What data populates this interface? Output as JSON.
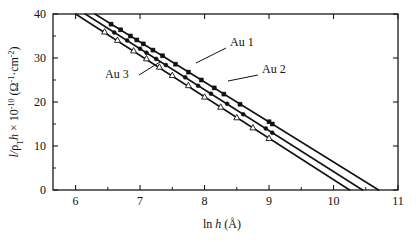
{
  "chart_data": {
    "type": "line",
    "title": "",
    "xlabel": "ln h (Å)",
    "ylabel": "l/ρTh × 10-10 (Ω-1·cm-2)",
    "ylabel_parts": {
      "lead": "l/",
      "rho": "ρ",
      "rho_sub": "T",
      "h": "h",
      "times": " × 10",
      "exp": "-10",
      "unit_open": " (Ω",
      "unit_exp1": "-1",
      "unit_mid": "·cm",
      "unit_exp2": "-2",
      "unit_close": ")"
    },
    "xlabel_parts": {
      "ln": "ln ",
      "h": "h",
      "unit": " (Å)"
    },
    "xlim": [
      5.65,
      11.0
    ],
    "ylim": [
      0,
      40
    ],
    "xticks": [
      6,
      7,
      8,
      9,
      10,
      11
    ],
    "xtick_labels": [
      "6",
      "7",
      "8",
      "9",
      "10",
      "11"
    ],
    "yticks": [
      0,
      10,
      20,
      30,
      40
    ],
    "ytick_labels": [
      "0",
      "10",
      "20",
      "30",
      "40"
    ],
    "xminor_ticks": [
      6.5,
      7.5,
      8.5,
      9.5,
      10.5
    ],
    "yminor_ticks": [
      5,
      15,
      25,
      35
    ],
    "grid": false,
    "legend_position": "inline-annotations",
    "series": [
      {
        "name": "Au 1",
        "marker": "filled-square",
        "fit_x": [
          6.3,
          10.7
        ],
        "fit_y": [
          40.0,
          0.0
        ],
        "slope": -9.09,
        "intercept": 97.27,
        "points_x": [
          6.55,
          6.7,
          6.85,
          6.95,
          7.05,
          7.2,
          7.35,
          7.55,
          7.75,
          7.95,
          8.15,
          8.3,
          8.55,
          9.0,
          9.05
        ],
        "points_y": [
          37.7,
          36.4,
          35.0,
          34.1,
          33.2,
          31.8,
          30.5,
          28.6,
          26.8,
          25.0,
          23.2,
          21.8,
          19.5,
          15.5,
          15.0
        ]
      },
      {
        "name": "Au 2",
        "marker": "filled-dot",
        "fit_x": [
          6.15,
          10.45
        ],
        "fit_y": [
          40.0,
          0.0
        ],
        "slope": -9.3,
        "intercept": 97.21,
        "points_x": [
          6.6,
          6.8,
          7.0,
          7.1,
          7.25,
          7.4,
          7.7,
          7.9,
          8.1,
          8.35,
          8.6,
          8.95,
          9.05
        ],
        "points_y": [
          35.8,
          34.0,
          32.1,
          31.2,
          29.8,
          28.4,
          25.6,
          23.7,
          21.9,
          19.6,
          17.2,
          14.0,
          13.0
        ]
      },
      {
        "name": "Au 3",
        "marker": "open-triangle",
        "fit_x": [
          6.0,
          10.25
        ],
        "fit_y": [
          40.0,
          0.0
        ],
        "slope": -9.41,
        "intercept": 96.47,
        "points_x": [
          6.45,
          6.65,
          6.9,
          7.1,
          7.3,
          7.5,
          7.75,
          8.0,
          8.25,
          8.5,
          8.75,
          9.0
        ],
        "points_y": [
          36.0,
          34.1,
          31.7,
          29.9,
          28.0,
          26.1,
          23.8,
          21.2,
          18.9,
          16.5,
          14.2,
          11.8
        ]
      }
    ],
    "annotations": [
      {
        "text": "Au 1",
        "text_x": 230,
        "text_y": 46,
        "leader_from_x": 226,
        "leader_from_y": 48,
        "leader_to_x": 196,
        "leader_to_y": 63
      },
      {
        "text": "Au 2",
        "text_x": 262,
        "text_y": 73,
        "leader_from_x": 258,
        "leader_from_y": 75,
        "leader_to_x": 228,
        "leader_to_y": 81
      },
      {
        "text": "Au 3",
        "text_x": 105,
        "text_y": 78,
        "leader_from_x": 139,
        "leader_from_y": 75,
        "leader_to_x": 160,
        "leader_to_y": 62
      }
    ]
  }
}
